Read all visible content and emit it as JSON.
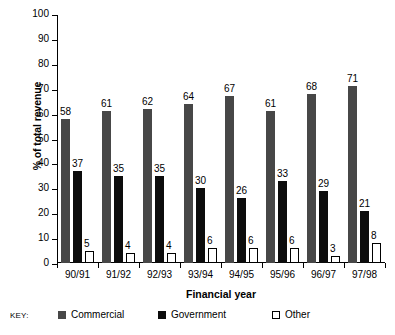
{
  "chart_data": {
    "type": "bar",
    "title": "",
    "xlabel": "Financial year",
    "ylabel": "% of total revenue",
    "ylim": [
      0,
      100
    ],
    "yticks": [
      0,
      10,
      20,
      30,
      40,
      50,
      60,
      70,
      80,
      90,
      100
    ],
    "ytick_labels": [
      "0",
      "10",
      "20",
      "30",
      "40",
      "50",
      "60",
      "70",
      "80",
      "90",
      "100"
    ],
    "grid": false,
    "legend_position": "bottom",
    "legend_prefix": "KEY:",
    "categories": [
      "90/91",
      "91/92",
      "92/93",
      "93/94",
      "94/95",
      "95/96",
      "96/97",
      "97/98"
    ],
    "series": [
      {
        "name": "Commercial",
        "color": "#474747",
        "values": [
          58,
          61,
          62,
          64,
          67,
          61,
          68,
          71
        ]
      },
      {
        "name": "Government",
        "color": "#0c0c0c",
        "values": [
          37,
          35,
          35,
          30,
          26,
          33,
          29,
          21
        ]
      },
      {
        "name": "Other",
        "color": "#ffffff",
        "values": [
          5,
          4,
          4,
          6,
          6,
          6,
          3,
          8
        ]
      }
    ]
  }
}
